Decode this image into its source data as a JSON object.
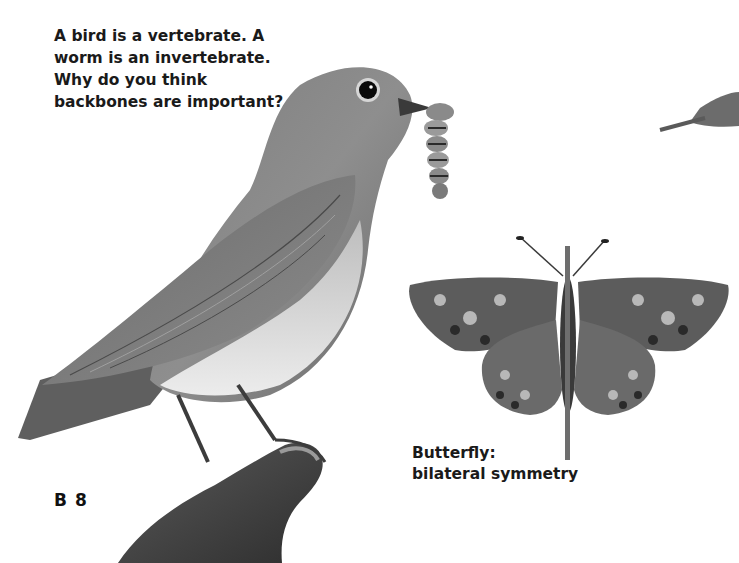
{
  "page": {
    "question": {
      "lines": [
        "A bird is a vertebrate. A",
        "worm is an invertebrate.",
        "Why do you think",
        "backbones are important?"
      ]
    },
    "caption": {
      "lines": [
        "Butterfly:",
        "bilateral symmetry"
      ]
    },
    "page_number": "B 8"
  },
  "images": {
    "bird": "bird-holding-worm",
    "worm": "caterpillar",
    "branch": "branch-perch",
    "butterfly": "butterfly-with-symmetry-line",
    "partial_insect": "partial-insect-cropped"
  },
  "colors": {
    "background": "#ffffff",
    "text": "#1a1a1a",
    "symmetry_line": "#6e6e6e"
  }
}
